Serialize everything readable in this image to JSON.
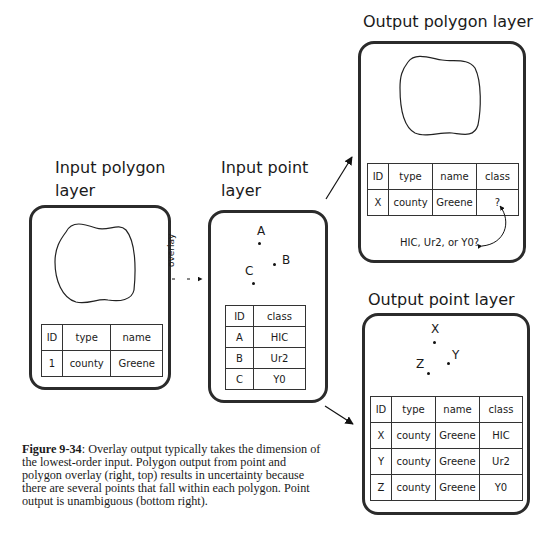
{
  "figure": {
    "panels": {
      "input_polygon": {
        "title_line1": "Input polygon",
        "title_line2": "layer",
        "table": {
          "headers": [
            "ID",
            "type",
            "name"
          ],
          "rows": [
            [
              "1",
              "county",
              "Greene"
            ]
          ]
        }
      },
      "input_point": {
        "title_line1": "Input point",
        "title_line2": "layer",
        "points": [
          {
            "label": "A"
          },
          {
            "label": "B"
          },
          {
            "label": "C"
          }
        ],
        "table": {
          "headers": [
            "ID",
            "class"
          ],
          "rows": [
            [
              "A",
              "HIC"
            ],
            [
              "B",
              "Ur2"
            ],
            [
              "C",
              "Y0"
            ]
          ]
        }
      },
      "output_polygon": {
        "title": "Output polygon layer",
        "table": {
          "headers": [
            "ID",
            "type",
            "name",
            "class"
          ],
          "rows": [
            [
              "X",
              "county",
              "Greene",
              "?"
            ]
          ]
        },
        "annotation": "HIC, Ur2, or Y0?"
      },
      "output_point": {
        "title": "Output point layer",
        "points": [
          {
            "label": "X"
          },
          {
            "label": "Y"
          },
          {
            "label": "Z"
          }
        ],
        "table": {
          "headers": [
            "ID",
            "type",
            "name",
            "class"
          ],
          "rows": [
            [
              "X",
              "county",
              "Greene",
              "HIC"
            ],
            [
              "Y",
              "county",
              "Greene",
              "Ur2"
            ],
            [
              "Z",
              "county",
              "Greene",
              "Y0"
            ]
          ]
        }
      }
    },
    "overlay_label": "overlay",
    "caption": {
      "label": "Figure 9-34",
      "text": ": Overlay output typically takes the dimension of the lowest-order input. Polygon output from point and polygon overlay (right, top) results in uncertainty because there are several points that fall within each polygon. Point output is unambiguous (bottom right)."
    }
  }
}
